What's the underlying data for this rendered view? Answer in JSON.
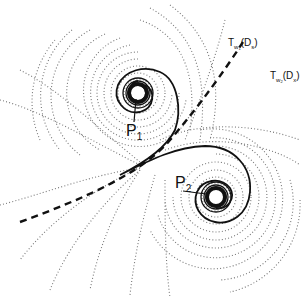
{
  "diagram": {
    "points": [
      {
        "name": "P",
        "subscript": "1",
        "cx": 138,
        "cy": 93,
        "label_x": 128,
        "label_y": 130
      },
      {
        "name": "P",
        "subscript": "2",
        "cx": 216,
        "cy": 197,
        "label_x": 176,
        "label_y": 190
      }
    ],
    "labels": [
      {
        "main": "T",
        "sub": "w",
        "subsub": "1",
        "arg": "(D",
        "argsub": "s",
        "close": ")",
        "x": 232,
        "y": 45
      },
      {
        "main": "T",
        "sub": "w",
        "subsub": "2",
        "arg": "(D",
        "argsub": "x",
        "close": ")",
        "x": 262,
        "y": 78
      }
    ],
    "colors": {
      "solid": "#111111",
      "dashed": "#111111",
      "dotted": "#777777"
    }
  }
}
